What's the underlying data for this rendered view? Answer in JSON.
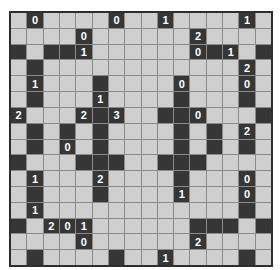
{
  "puzzle": {
    "type": "light-up",
    "rows": 16,
    "cols": 16,
    "legend": {
      ".": "empty-white-cell",
      "#": "black-wall",
      "0-4": "numbered-black-wall"
    },
    "colors": {
      "empty_cell": "#cfcfcf",
      "wall_cell": "#363636",
      "grid_line": "#8a8a8a",
      "border": "#2e2e2e",
      "number_text": "#ffffff"
    },
    "grid": [
      ".0....0..1....1.",
      "....0......2....",
      "#.##1......0#1.#",
      ".#............2.",
      ".1...#....0...0.",
      ".#...1....#...#.",
      "2...2#3..##0...#",
      ".#.#.#....#.#.2.",
      ".#.0.#....#.#.#.",
      "#...###..###....",
      ".1...2....#...0.",
      ".#...#....1...0.",
      ".1............#.",
      "#.201......###.#",
      "....0......2....",
      ".#....#..1....#."
    ]
  }
}
